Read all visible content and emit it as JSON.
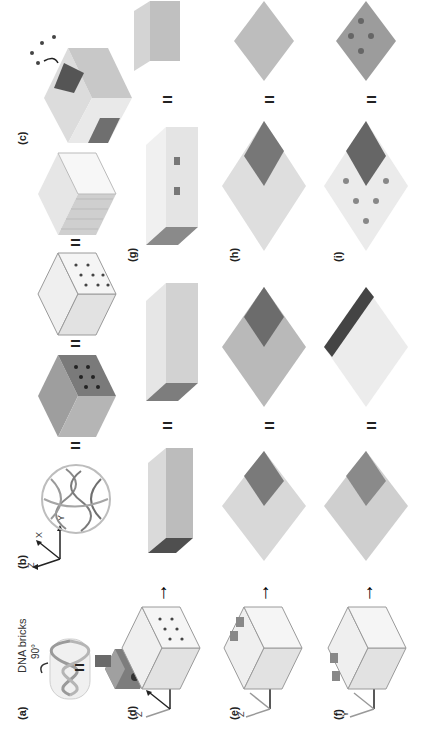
{
  "figure": {
    "orientation": "rotated 90 degrees counter-clockwise",
    "panels": [
      {
        "id": "a",
        "label": "(a)",
        "caption_text": "DNA bricks",
        "rotation_note": "90°"
      },
      {
        "id": "b",
        "label": "(b)",
        "axes": [
          "Z",
          "X",
          "Y"
        ]
      },
      {
        "id": "c",
        "label": "(c)"
      },
      {
        "id": "d",
        "label": "(d)",
        "axes": [
          "Z",
          "X",
          "Y"
        ]
      },
      {
        "id": "e",
        "label": "(e)",
        "axes": [
          "Z",
          "X",
          "Y"
        ]
      },
      {
        "id": "f",
        "label": "(f)",
        "axes": [
          "Y",
          "X",
          "Z"
        ]
      },
      {
        "id": "g",
        "label": "(g)"
      },
      {
        "id": "h",
        "label": "(h)"
      },
      {
        "id": "i",
        "label": "(i)"
      }
    ],
    "symbols": {
      "equals": "=",
      "up_arrow": "↑"
    },
    "colors": {
      "dark_face": "#6f6f6f",
      "mid_face": "#a8a8a8",
      "light_face": "#dcdcdc",
      "marker": "#9a9a9a",
      "ink": "#222222"
    }
  }
}
